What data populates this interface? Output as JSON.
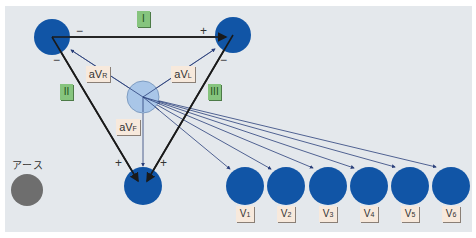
{
  "diagram": {
    "colors": {
      "background": "#e4e8ec",
      "electrode": "#1155a6",
      "central_terminal": "#a9c6e8",
      "ground": "#6e6e6e",
      "limb_lead_label_bg": "#86c47e",
      "augmented_label_bg": "#f7e9dc",
      "lead_line": "#1a1a1a",
      "chest_line": "#2a3f7a"
    },
    "limb_leads": [
      {
        "label": "I",
        "neg": "−",
        "pos": "+"
      },
      {
        "label": "II",
        "neg": "−",
        "pos": "+"
      },
      {
        "label": "III",
        "neg": "−",
        "pos": "+"
      }
    ],
    "augmented_leads": [
      {
        "main": "aV",
        "sub": "R"
      },
      {
        "main": "aV",
        "sub": "L"
      },
      {
        "main": "aV",
        "sub": "F"
      }
    ],
    "ground_label": "アース",
    "chest_leads": [
      {
        "main": "V",
        "sub": "1"
      },
      {
        "main": "V",
        "sub": "2"
      },
      {
        "main": "V",
        "sub": "3"
      },
      {
        "main": "V",
        "sub": "4"
      },
      {
        "main": "V",
        "sub": "5"
      },
      {
        "main": "V",
        "sub": "6"
      }
    ]
  }
}
